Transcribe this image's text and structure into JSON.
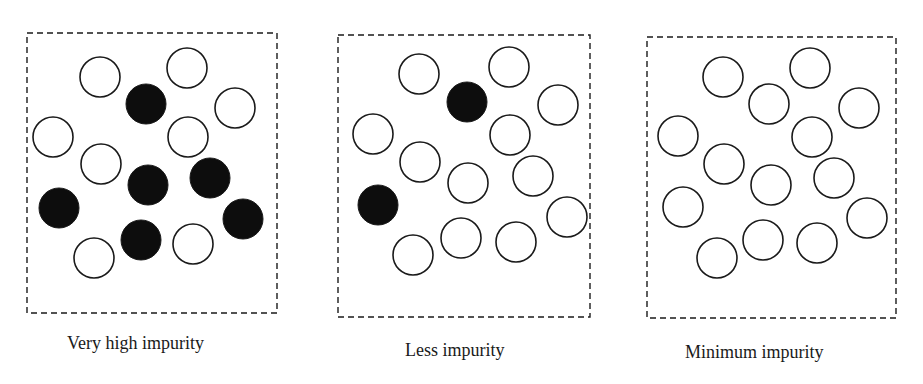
{
  "colors": {
    "stroke": "#1a1a1a",
    "impurity_fill": "#0d0d0d",
    "pure_fill": "#ffffff"
  },
  "circle_radius": 20,
  "panels": [
    {
      "label": "Very high impurity",
      "box": {
        "x": 27,
        "y": 33,
        "w": 250,
        "h": 280
      },
      "label_pos": {
        "x": 67,
        "y": 333
      },
      "open_circles": [
        [
          100,
          77
        ],
        [
          187,
          68
        ],
        [
          235,
          108
        ],
        [
          53,
          137
        ],
        [
          188,
          137
        ],
        [
          101,
          164
        ],
        [
          193,
          244
        ],
        [
          94,
          258
        ]
      ],
      "filled_circles": [
        [
          146,
          104
        ],
        [
          148,
          185
        ],
        [
          210,
          178
        ],
        [
          59,
          208
        ],
        [
          243,
          219
        ],
        [
          141,
          240
        ]
      ]
    },
    {
      "label": "Less impurity",
      "box": {
        "x": 338,
        "y": 35,
        "w": 252,
        "h": 282
      },
      "label_pos": {
        "x": 405,
        "y": 340
      },
      "open_circles": [
        [
          419,
          74
        ],
        [
          509,
          67
        ],
        [
          558,
          105
        ],
        [
          373,
          134
        ],
        [
          510,
          135
        ],
        [
          420,
          162
        ],
        [
          468,
          183
        ],
        [
          533,
          176
        ],
        [
          567,
          217
        ],
        [
          461,
          238
        ],
        [
          516,
          242
        ],
        [
          413,
          255
        ]
      ],
      "filled_circles": [
        [
          467,
          102
        ],
        [
          378,
          205
        ]
      ]
    },
    {
      "label": "Minimum impurity",
      "box": {
        "x": 647,
        "y": 37,
        "w": 249,
        "h": 281
      },
      "label_pos": {
        "x": 685,
        "y": 342
      },
      "open_circles": [
        [
          723,
          77
        ],
        [
          810,
          68
        ],
        [
          769,
          104
        ],
        [
          859,
          108
        ],
        [
          678,
          136
        ],
        [
          812,
          137
        ],
        [
          724,
          164
        ],
        [
          771,
          185
        ],
        [
          834,
          178
        ],
        [
          683,
          207
        ],
        [
          867,
          218
        ],
        [
          763,
          240
        ],
        [
          817,
          243
        ],
        [
          717,
          258
        ]
      ],
      "filled_circles": []
    }
  ]
}
